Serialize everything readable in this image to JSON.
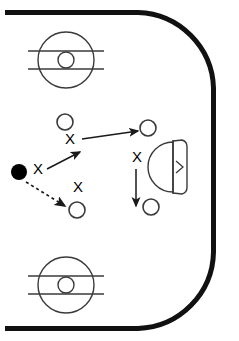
{
  "diagram": {
    "sport": "ice-hockey",
    "view": "offensive-zone-half-rink",
    "colors": {
      "boards": "#111111",
      "ice": "#ffffff",
      "markings": "#3a3a3a",
      "puck": "#000000",
      "player_stroke": "#3a3a3a",
      "arrow": "#1a1a1a"
    }
  },
  "rink": {
    "boards_label": "rink boards",
    "stroke_width": 5,
    "corner_radius": 78,
    "left_open": true,
    "bounds": {
      "x": 5,
      "y": 10,
      "width": 211,
      "height": 320
    }
  },
  "faceoff_circles": [
    {
      "id": "faceoff-circle-top",
      "label": "Top faceoff circle",
      "cx": 66,
      "cy": 60,
      "r": 28,
      "inner_r": 8,
      "hash_offset": 9
    },
    {
      "id": "faceoff-circle-bottom",
      "label": "Bottom faceoff circle",
      "cx": 66,
      "cy": 285,
      "r": 28,
      "inner_r": 8,
      "hash_offset": 9
    }
  ],
  "goal": {
    "id": "goal-crease",
    "label": "Goal crease and net",
    "crease_cx": 172,
    "crease_cy": 167,
    "crease_r": 25,
    "goal_line_x": 173,
    "goal_line_top": 140,
    "goal_line_bottom": 194,
    "net_depth": 13,
    "arrow_marker": ">"
  },
  "players": [
    {
      "id": "player-o-1",
      "label": "O1",
      "type": "circle",
      "cx": 65,
      "cy": 122,
      "r": 8
    },
    {
      "id": "player-o-2",
      "label": "O2",
      "type": "circle",
      "cx": 148,
      "cy": 128,
      "r": 8
    },
    {
      "id": "player-o-3",
      "label": "O3",
      "type": "circle",
      "cx": 77,
      "cy": 210,
      "r": 8
    },
    {
      "id": "player-o-4",
      "label": "O4",
      "type": "circle",
      "cx": 151,
      "cy": 207,
      "r": 8
    }
  ],
  "puck": {
    "id": "puck",
    "label": "Puck",
    "cx": 19,
    "cy": 172,
    "r": 8
  },
  "defenders": [
    {
      "id": "defender-x-1",
      "label": "X",
      "x": 38,
      "y": 170
    },
    {
      "id": "defender-x-2",
      "label": "X",
      "x": 70,
      "y": 140
    },
    {
      "id": "defender-x-3",
      "label": "X",
      "x": 78,
      "y": 188
    },
    {
      "id": "defender-x-4",
      "label": "X",
      "x": 137,
      "y": 158
    }
  ],
  "movements": [
    {
      "id": "arrow-pass-up-right",
      "label": "Skate up-right from puck carrier",
      "style": "solid",
      "x1": 47,
      "y1": 169,
      "x2": 80,
      "y2": 152
    },
    {
      "id": "arrow-pass-horizontal",
      "label": "Pass across to right winger",
      "style": "solid",
      "x1": 82,
      "y1": 139,
      "x2": 138,
      "y2": 131
    },
    {
      "id": "arrow-pass-down-right-dashed",
      "label": "Pass down-right to low player",
      "style": "dashed",
      "x1": 26,
      "y1": 182,
      "x2": 65,
      "y2": 206
    },
    {
      "id": "arrow-drive-down",
      "label": "Drive to the net",
      "style": "solid",
      "x1": 136,
      "y1": 169,
      "x2": 136,
      "y2": 206
    }
  ]
}
